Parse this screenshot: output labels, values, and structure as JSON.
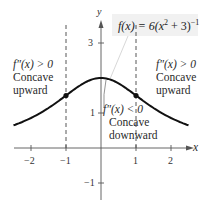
{
  "chart_data": {
    "type": "line",
    "title": "",
    "function": "f(x) = 6(x^2 + 3)^-1",
    "xlabel": "x",
    "ylabel": "y",
    "xlim": [
      -2.5,
      2.5
    ],
    "ylim": [
      -1.5,
      3.5
    ],
    "x_ticks": [
      -2,
      -1,
      1,
      2
    ],
    "y_ticks": [
      3,
      1,
      -1
    ],
    "series": [
      {
        "name": "f(x) = 6(x^2 + 3)^-1",
        "x": [
          -2.5,
          -2,
          -1.5,
          -1,
          -0.5,
          0,
          0.5,
          1,
          1.5,
          2,
          2.5
        ],
        "values": [
          0.65,
          0.86,
          1.14,
          1.5,
          1.85,
          2.0,
          1.85,
          1.5,
          1.14,
          0.86,
          0.65
        ]
      }
    ],
    "inflection_points": [
      {
        "x": -1,
        "y": 1.5
      },
      {
        "x": 1,
        "y": 1.5
      }
    ],
    "vertical_dashed_lines": [
      -1,
      1
    ],
    "annotations": [
      {
        "text": "f″(x) > 0",
        "sub": [
          "Concave",
          "upward"
        ],
        "region": "x < -1"
      },
      {
        "text": "f″(x) < 0",
        "sub": [
          "Concave",
          "downward"
        ],
        "region": "-1 < x < 1"
      },
      {
        "text": "f″(x) > 0",
        "sub": [
          "Concave",
          "upward"
        ],
        "region": "x > 1"
      }
    ],
    "grid": false,
    "legend": "none"
  },
  "labels": {
    "formula_f": "f",
    "formula_rest": "(x) = 6(x",
    "formula_sq": "2",
    "formula_tail": " + 3)",
    "formula_exp": "−1",
    "left": {
      "cond": "f″(x) > 0",
      "l1": "Concave",
      "l2": "upward"
    },
    "center": {
      "cond": "f″(x) < 0",
      "l1": "Concave",
      "l2": "downward"
    },
    "right": {
      "cond": "f″(x) > 0",
      "l1": "Concave",
      "l2": "upward"
    },
    "x_axis": "x",
    "y_axis": "y",
    "ticks": {
      "xm2": "−2",
      "xm1": "−1",
      "x1": "1",
      "x2": "2",
      "y3": "3",
      "y1": "1",
      "ym1": "−1"
    }
  }
}
